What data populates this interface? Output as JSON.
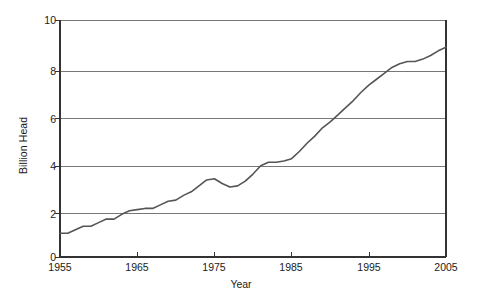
{
  "chart_data": {
    "type": "line",
    "title": "",
    "subtitle": "",
    "xlabel": "Year",
    "ylabel": "Billion Head",
    "xlim": [
      1955,
      2005
    ],
    "ylim": [
      0,
      10
    ],
    "xticks": [
      1955,
      1965,
      1975,
      1985,
      1995,
      2005
    ],
    "yticks": [
      0,
      2,
      4,
      6,
      8,
      10
    ],
    "grid": "horizontal",
    "legend": "none",
    "line_color": "#555555",
    "axis_color": "#333333",
    "grid_color": "#777777",
    "background": "#ffffff",
    "series": [
      {
        "name": "Billion Head",
        "x": [
          1955,
          1956,
          1957,
          1958,
          1959,
          1960,
          1961,
          1962,
          1963,
          1964,
          1965,
          1966,
          1967,
          1968,
          1969,
          1970,
          1971,
          1972,
          1973,
          1974,
          1975,
          1976,
          1977,
          1978,
          1979,
          1980,
          1981,
          1982,
          1983,
          1984,
          1985,
          1986,
          1987,
          1988,
          1989,
          1990,
          1991,
          1992,
          1993,
          1994,
          1995,
          1996,
          1997,
          1998,
          1999,
          2000,
          2001,
          2002,
          2003,
          2004,
          2005
        ],
        "values": [
          1.0,
          1.0,
          1.15,
          1.3,
          1.3,
          1.45,
          1.6,
          1.6,
          1.8,
          1.95,
          2.0,
          2.05,
          2.05,
          2.2,
          2.35,
          2.4,
          2.6,
          2.75,
          3.0,
          3.25,
          3.3,
          3.1,
          2.95,
          3.0,
          3.2,
          3.5,
          3.85,
          4.0,
          4.0,
          4.05,
          4.15,
          4.45,
          4.8,
          5.1,
          5.45,
          5.7,
          6.0,
          6.3,
          6.6,
          6.95,
          7.25,
          7.5,
          7.75,
          8.0,
          8.15,
          8.25,
          8.25,
          8.35,
          8.5,
          8.7,
          8.85
        ]
      }
    ]
  },
  "axes": {
    "ylabel": "Billion Head",
    "xlabel": "Year",
    "yticks": [
      "0",
      "2",
      "4",
      "6",
      "8",
      "10"
    ],
    "xticks": [
      "1955",
      "1965",
      "1975",
      "1985",
      "1995",
      "2005"
    ]
  }
}
